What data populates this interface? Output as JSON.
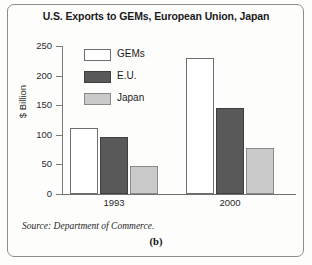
{
  "chart_data": {
    "type": "bar",
    "title": "U.S. Exports to GEMs, European Union, Japan",
    "xlabel": "",
    "ylabel": "$ Billion",
    "categories": [
      "1993",
      "2000"
    ],
    "series": [
      {
        "name": "GEMs",
        "values": [
          112,
          230
        ],
        "color": "#ffffff"
      },
      {
        "name": "E.U.",
        "values": [
          97,
          145
        ],
        "color": "#595959"
      },
      {
        "name": "Japan",
        "values": [
          47,
          78
        ],
        "color": "#cacaca"
      }
    ],
    "ylim": [
      0,
      250
    ],
    "yticks": [
      0,
      50,
      100,
      150,
      200,
      250
    ],
    "ytick_labels": [
      "0",
      "50",
      "100",
      "150",
      "200",
      "250"
    ],
    "grid": false,
    "legend_position": "upper-left-inside"
  },
  "footer": {
    "source": "Source: Department of Commerce.",
    "panel_label": "(b)"
  }
}
